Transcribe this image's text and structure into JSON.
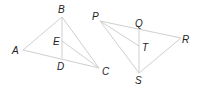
{
  "figures": [
    {
      "name": "figure-left",
      "points": {
        "A": {
          "x": 23,
          "y": 50
        },
        "B": {
          "x": 62,
          "y": 17
        },
        "C": {
          "x": 99,
          "y": 68
        },
        "D": {
          "x": 62,
          "y": 58
        },
        "E": {
          "x": 62,
          "y": 41
        }
      },
      "labels": {
        "A": "A",
        "B": "B",
        "C": "C",
        "D": "D",
        "E": "E"
      },
      "segments": [
        [
          "A",
          "B"
        ],
        [
          "B",
          "C"
        ],
        [
          "A",
          "C"
        ],
        [
          "B",
          "D"
        ],
        [
          "E",
          "C"
        ]
      ]
    },
    {
      "name": "figure-right",
      "points": {
        "P": {
          "x": 100,
          "y": 21
        },
        "Q": {
          "x": 139,
          "y": 30
        },
        "R": {
          "x": 181,
          "y": 38
        },
        "S": {
          "x": 139,
          "y": 73
        },
        "T": {
          "x": 139,
          "y": 46
        }
      },
      "labels": {
        "P": "P",
        "Q": "Q",
        "R": "R",
        "S": "S",
        "T": "T"
      },
      "segments": [
        [
          "P",
          "R"
        ],
        [
          "P",
          "S"
        ],
        [
          "R",
          "S"
        ],
        [
          "Q",
          "S"
        ],
        [
          "P",
          "T"
        ]
      ]
    }
  ],
  "colors": {
    "line": "#cfcfcf",
    "label": "#222222",
    "background": "#ffffff"
  }
}
